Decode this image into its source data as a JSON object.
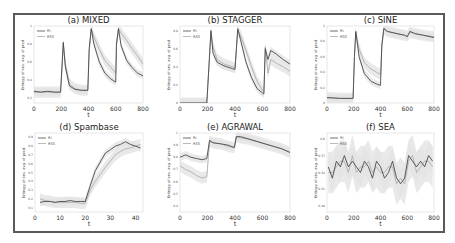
{
  "figure": {
    "legend": [
      "RI",
      "RSS"
    ],
    "ylabel": "Entropy of ens. avg. of pred.",
    "xlabel": "t",
    "colors": {
      "RI": "#4a4a4a",
      "RSS": "#a8a8a8",
      "band": "#e3e3e3",
      "frame": "#5a5a5a"
    }
  },
  "chart_data": [
    {
      "type": "line",
      "title": "(a) MIXED",
      "xlabel": "t",
      "ylabel": "Entropy of ens. avg. of pred.",
      "xlim": [
        0,
        800
      ],
      "ylim": [
        0.15,
        1.0
      ],
      "xticks": [
        0,
        200,
        400,
        600,
        800
      ],
      "yticks": [
        0.2,
        0.4,
        0.6,
        0.8,
        1.0
      ],
      "legend": [
        "RI",
        "RSS"
      ],
      "legend_position": "upper left",
      "grid": false,
      "x": [
        0,
        50,
        100,
        150,
        195,
        205,
        215,
        230,
        260,
        300,
        350,
        395,
        405,
        420,
        440,
        480,
        520,
        560,
        600,
        605,
        620,
        640,
        680,
        720,
        760,
        800
      ],
      "series": [
        {
          "name": "RI",
          "values": [
            0.28,
            0.27,
            0.28,
            0.27,
            0.27,
            0.55,
            0.82,
            0.55,
            0.34,
            0.3,
            0.29,
            0.29,
            0.75,
            0.97,
            0.8,
            0.6,
            0.48,
            0.42,
            0.38,
            0.8,
            0.97,
            0.78,
            0.62,
            0.54,
            0.48,
            0.45
          ]
        },
        {
          "name": "RSS",
          "values": [
            0.27,
            0.27,
            0.27,
            0.27,
            0.27,
            0.5,
            0.8,
            0.58,
            0.36,
            0.31,
            0.29,
            0.29,
            0.72,
            0.97,
            0.88,
            0.74,
            0.62,
            0.55,
            0.48,
            0.78,
            0.97,
            0.92,
            0.84,
            0.75,
            0.67,
            0.58
          ]
        }
      ]
    },
    {
      "type": "line",
      "title": "(b) STAGGER",
      "xlabel": "t",
      "ylabel": "Entropy of ens. avg. of pred.",
      "xlim": [
        0,
        800
      ],
      "ylim": [
        0.0,
        0.85
      ],
      "xticks": [
        0,
        200,
        400,
        600,
        800
      ],
      "yticks": [
        0.0,
        0.2,
        0.4,
        0.6,
        0.8
      ],
      "legend": [
        "RI",
        "RSS"
      ],
      "legend_position": "upper left",
      "grid": false,
      "x": [
        0,
        100,
        195,
        210,
        225,
        240,
        270,
        320,
        380,
        400,
        420,
        440,
        480,
        520,
        560,
        600,
        610,
        620,
        640,
        660,
        700,
        750,
        800
      ],
      "series": [
        {
          "name": "RI",
          "values": [
            0.0,
            0.0,
            0.0,
            0.4,
            0.8,
            0.55,
            0.45,
            0.41,
            0.38,
            0.37,
            0.82,
            0.7,
            0.45,
            0.28,
            0.16,
            0.11,
            0.1,
            0.6,
            0.48,
            0.58,
            0.54,
            0.48,
            0.43
          ]
        },
        {
          "name": "RSS",
          "values": [
            0.0,
            0.0,
            0.0,
            0.38,
            0.78,
            0.62,
            0.48,
            0.43,
            0.4,
            0.39,
            0.8,
            0.75,
            0.58,
            0.4,
            0.24,
            0.14,
            0.12,
            0.62,
            0.33,
            0.48,
            0.44,
            0.4,
            0.35
          ]
        }
      ]
    },
    {
      "type": "line",
      "title": "(c) SINE",
      "xlabel": "t",
      "ylabel": "Entropy of ens. avg. of pred.",
      "xlim": [
        0,
        800
      ],
      "ylim": [
        0.0,
        1.0
      ],
      "xticks": [
        0,
        200,
        400,
        600,
        800
      ],
      "yticks": [
        0.0,
        0.2,
        0.4,
        0.6,
        0.8,
        1.0
      ],
      "legend": [
        "RI",
        "RSS"
      ],
      "legend_position": "upper left",
      "grid": false,
      "x": [
        0,
        100,
        195,
        205,
        215,
        240,
        280,
        330,
        380,
        400,
        410,
        425,
        450,
        500,
        580,
        600,
        620,
        660,
        720,
        800
      ],
      "series": [
        {
          "name": "RI",
          "values": [
            0.07,
            0.06,
            0.06,
            0.6,
            0.93,
            0.6,
            0.38,
            0.28,
            0.24,
            0.23,
            0.75,
            0.97,
            0.93,
            0.91,
            0.88,
            0.86,
            0.93,
            0.9,
            0.88,
            0.85
          ]
        },
        {
          "name": "RSS",
          "values": [
            0.07,
            0.06,
            0.06,
            0.58,
            0.92,
            0.7,
            0.52,
            0.44,
            0.39,
            0.37,
            0.74,
            0.96,
            0.93,
            0.91,
            0.88,
            0.87,
            0.92,
            0.9,
            0.88,
            0.86
          ]
        }
      ]
    },
    {
      "type": "line",
      "title": "(d) Spambase",
      "xlabel": "t",
      "ylabel": "Entropy of ens. avg. of pred.",
      "xlim": [
        0,
        43
      ],
      "ylim": [
        0.05,
        0.95
      ],
      "xticks": [
        0,
        10,
        20,
        30,
        40
      ],
      "yticks": [
        0.1,
        0.2,
        0.3,
        0.4,
        0.5,
        0.6,
        0.7,
        0.8,
        0.9
      ],
      "legend": [
        "RI",
        "RSS"
      ],
      "legend_position": "upper left",
      "grid": false,
      "x": [
        2,
        4,
        6,
        8,
        10,
        12,
        14,
        16,
        18,
        20,
        22,
        24,
        26,
        28,
        30,
        32,
        34,
        36,
        38,
        40,
        42
      ],
      "series": [
        {
          "name": "RI",
          "values": [
            0.16,
            0.17,
            0.17,
            0.16,
            0.17,
            0.17,
            0.18,
            0.17,
            0.17,
            0.17,
            0.35,
            0.52,
            0.62,
            0.72,
            0.76,
            0.8,
            0.82,
            0.85,
            0.82,
            0.8,
            0.78
          ]
        },
        {
          "name": "RSS",
          "values": [
            0.2,
            0.18,
            0.17,
            0.16,
            0.16,
            0.16,
            0.16,
            0.16,
            0.15,
            0.15,
            0.3,
            0.4,
            0.48,
            0.56,
            0.63,
            0.7,
            0.74,
            0.77,
            0.78,
            0.8,
            0.82
          ]
        }
      ]
    },
    {
      "type": "line",
      "title": "(e) AGRAWAL",
      "xlabel": "t",
      "ylabel": "Entropy of ens. avg. of pred.",
      "xlim": [
        0,
        800
      ],
      "ylim": [
        0.35,
        1.0
      ],
      "xticks": [
        0,
        200,
        400,
        600,
        800
      ],
      "yticks": [
        0.4,
        0.5,
        0.6,
        0.7,
        0.8,
        0.9,
        1.0
      ],
      "legend": [
        "RI",
        "RSS"
      ],
      "legend_position": "upper left",
      "grid": false,
      "x": [
        0,
        40,
        80,
        120,
        160,
        195,
        215,
        240,
        300,
        350,
        395,
        410,
        440,
        500,
        560,
        620,
        680,
        740,
        800
      ],
      "series": [
        {
          "name": "RI",
          "values": [
            0.8,
            0.82,
            0.8,
            0.79,
            0.78,
            0.79,
            0.94,
            0.92,
            0.91,
            0.9,
            0.88,
            0.97,
            0.97,
            0.95,
            0.93,
            0.91,
            0.89,
            0.87,
            0.84
          ]
        },
        {
          "name": "RSS",
          "values": [
            0.73,
            0.7,
            0.68,
            0.65,
            0.63,
            0.64,
            0.93,
            0.92,
            0.91,
            0.89,
            0.88,
            0.97,
            0.96,
            0.95,
            0.93,
            0.91,
            0.89,
            0.87,
            0.84
          ]
        }
      ]
    },
    {
      "type": "line",
      "title": "(f) SEA",
      "xlabel": "t",
      "ylabel": "Entropy of ens. avg. of pred.",
      "xlim": [
        0,
        800
      ],
      "ylim": [
        0.47,
        0.61
      ],
      "xticks": [
        0,
        200,
        400,
        600,
        800
      ],
      "yticks": [
        0.48,
        0.51,
        0.54,
        0.57,
        0.6
      ],
      "legend": [
        "RI",
        "RSS"
      ],
      "legend_position": "upper left",
      "grid": false,
      "x": [
        10,
        40,
        70,
        100,
        130,
        160,
        190,
        220,
        250,
        280,
        310,
        340,
        370,
        400,
        430,
        460,
        490,
        520,
        550,
        580,
        610,
        640,
        670,
        700,
        730,
        760,
        790
      ],
      "series": [
        {
          "name": "RI",
          "values": [
            0.55,
            0.53,
            0.56,
            0.55,
            0.57,
            0.55,
            0.56,
            0.55,
            0.54,
            0.56,
            0.55,
            0.53,
            0.56,
            0.55,
            0.53,
            0.54,
            0.56,
            0.53,
            0.52,
            0.53,
            0.57,
            0.56,
            0.55,
            0.56,
            0.55,
            0.57,
            0.56
          ]
        },
        {
          "name": "RSS",
          "values": [
            0.54,
            0.54,
            0.55,
            0.56,
            0.56,
            0.54,
            0.57,
            0.54,
            0.55,
            0.55,
            0.56,
            0.54,
            0.55,
            0.54,
            0.54,
            0.55,
            0.55,
            0.52,
            0.53,
            0.52,
            0.56,
            0.57,
            0.54,
            0.55,
            0.56,
            0.56,
            0.55
          ]
        }
      ]
    }
  ]
}
